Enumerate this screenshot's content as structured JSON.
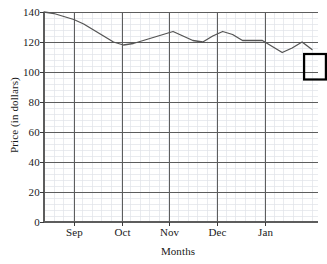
{
  "chart_data": {
    "type": "line",
    "title": "",
    "xlabel": "Months",
    "ylabel": "Price (in dollars)",
    "xtick_labels": [
      "Sep",
      "Oct",
      "Nov",
      "Dec",
      "Jan"
    ],
    "ytick_labels": [
      "0",
      "20",
      "40",
      "60",
      "80",
      "100",
      "120",
      "140"
    ],
    "ytick_values": [
      0,
      20,
      40,
      60,
      80,
      100,
      120,
      140
    ],
    "ylim": [
      0,
      140
    ],
    "xlim": [
      0,
      27
    ],
    "grid": true,
    "grid_major_color": "#555555",
    "grid_minor_color": "#d9dde2",
    "line_color": "#555555",
    "legend": "none",
    "x": [
      0,
      1,
      2,
      3,
      4,
      5,
      6,
      7,
      8,
      9,
      10,
      11,
      12,
      13,
      14,
      15,
      16,
      17,
      18,
      19,
      20,
      21,
      22,
      23,
      24,
      25,
      26,
      27
    ],
    "values": [
      140,
      139,
      137,
      135,
      132,
      128,
      124,
      120,
      118,
      119,
      121,
      123,
      125,
      127,
      124,
      121,
      120,
      124,
      127,
      125,
      121,
      121,
      121,
      117,
      113,
      116,
      120,
      115
    ],
    "series": [
      {
        "name": "Price",
        "values": [
          140,
          139,
          137,
          135,
          132,
          128,
          124,
          120,
          118,
          119,
          121,
          123,
          125,
          127,
          124,
          121,
          120,
          124,
          127,
          125,
          121,
          121,
          121,
          117,
          113,
          116,
          120,
          115
        ]
      }
    ],
    "annotations": [
      {
        "type": "highlight-box",
        "label": "minimum-highlight",
        "x_range": [
          26.2,
          28.4
        ],
        "y_range": [
          95,
          112
        ],
        "color": "#000000"
      }
    ]
  },
  "axes": {
    "y_title": "Price (in dollars)",
    "x_title": "Months"
  }
}
